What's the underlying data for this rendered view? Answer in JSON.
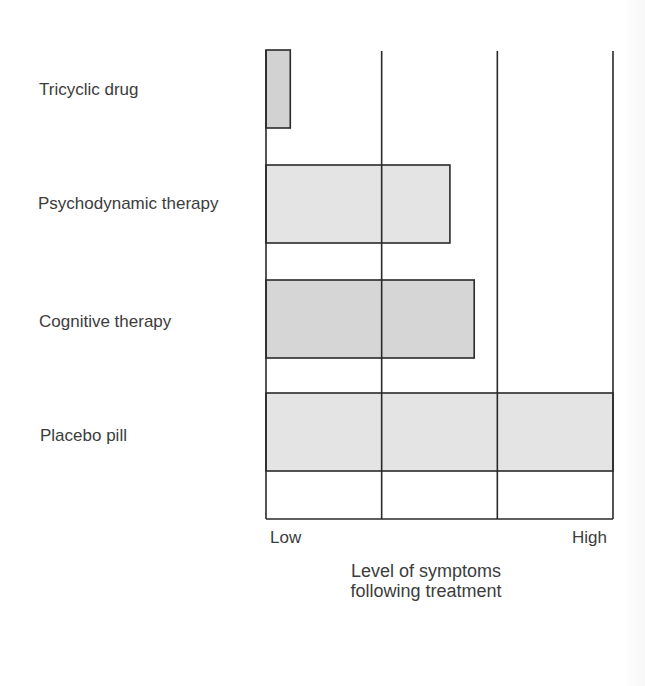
{
  "chart_data": {
    "type": "bar",
    "orientation": "horizontal",
    "title": "",
    "categories": [
      "Tricyclic drug",
      "Psychodynamic therapy",
      "Cognitive therapy",
      "Placebo pill"
    ],
    "values": [
      0.07,
      0.53,
      0.6,
      1.0
    ],
    "value_scale_note": "relative level on 0 (Low) to 1 (High) scale, estimated from bar length",
    "xlabel": "Level of symptoms following treatment",
    "xlabel_lines": [
      "Level of symptoms",
      "following treatment"
    ],
    "ylabel": "",
    "x_tick_labels": {
      "min": "Low",
      "max": "High"
    },
    "xlim": [
      0,
      1
    ],
    "grid": {
      "vertical_lines": 4,
      "horizontal": false
    },
    "legend": null,
    "bar_colors": [
      "#d2d2d2",
      "#e4e4e4",
      "#d6d6d6",
      "#e4e4e4"
    ],
    "border_color": "#2a2a2a"
  },
  "labels": {
    "categories": [
      "Tricyclic drug",
      "Psychodynamic therapy",
      "Cognitive therapy",
      "Placebo pill"
    ],
    "low": "Low",
    "high": "High",
    "axis_line1": "Level of symptoms",
    "axis_line2": "following treatment"
  }
}
